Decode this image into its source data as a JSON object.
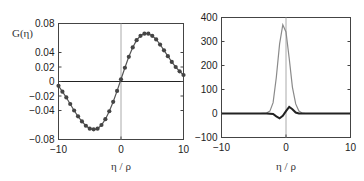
{
  "chart_data": [
    {
      "type": "line",
      "panel": "left",
      "title": "",
      "ylabel": "G(η)",
      "xlabel": "η / ρ",
      "xlim": [
        -10,
        10
      ],
      "ylim": [
        -0.08,
        0.08
      ],
      "xticks": [
        "-10",
        "0",
        "10"
      ],
      "yticks": [
        "0.08",
        "0.04",
        "0.02",
        "0",
        "-0.02",
        "-0.04",
        "-0.08"
      ],
      "ytick_values": [
        0.08,
        0.04,
        0.02,
        0,
        -0.02,
        -0.04,
        -0.08
      ],
      "grid": false,
      "reference_lines": {
        "y0": true,
        "x0": true
      },
      "series": [
        {
          "name": "G(η)",
          "style": "line-with-dots",
          "color": "#555555",
          "marker_color": "#444444",
          "x": [
            -10,
            -9.375,
            -8.75,
            -8.125,
            -7.5,
            -6.875,
            -6.25,
            -5.625,
            -5,
            -4.375,
            -3.75,
            -3.125,
            -2.5,
            -1.875,
            -1.25,
            -0.625,
            0,
            0.625,
            1.25,
            1.875,
            2.5,
            3.125,
            3.75,
            4.375,
            5,
            5.625,
            6.25,
            6.875,
            7.5,
            8.125,
            8.75,
            9.375,
            10
          ],
          "y": [
            -0.006,
            -0.014,
            -0.022,
            -0.031,
            -0.04,
            -0.048,
            -0.055,
            -0.061,
            -0.065,
            -0.066,
            -0.065,
            -0.06,
            -0.052,
            -0.041,
            -0.028,
            -0.013,
            0.003,
            0.019,
            0.034,
            0.047,
            0.057,
            0.063,
            0.066,
            0.066,
            0.063,
            0.058,
            0.051,
            0.043,
            0.035,
            0.027,
            0.02,
            0.014,
            0.009
          ]
        }
      ]
    },
    {
      "type": "line",
      "panel": "right",
      "title": "",
      "ylabel": "",
      "xlabel": "η / ρ",
      "xlim": [
        -10,
        10
      ],
      "ylim": [
        -100,
        400
      ],
      "xticks": [
        "-10",
        "0",
        "10"
      ],
      "yticks": [
        "400",
        "300",
        "200",
        "100",
        "0",
        "-100"
      ],
      "ytick_values": [
        400,
        300,
        200,
        100,
        0,
        -100
      ],
      "grid": false,
      "reference_lines": {
        "x0": true
      },
      "series": [
        {
          "name": "peak (gray)",
          "color": "#8a8a8a",
          "x": [
            -10,
            -4,
            -3,
            -2.5,
            -2,
            -1.5,
            -1,
            -0.5,
            0,
            0.5,
            1,
            1.5,
            2,
            2.5,
            3,
            10
          ],
          "y": [
            0,
            0,
            2,
            10,
            45,
            150,
            290,
            370,
            340,
            230,
            110,
            40,
            10,
            2,
            0,
            0
          ]
        },
        {
          "name": "oscillation (dark)",
          "color": "#222222",
          "x": [
            -10,
            -3,
            -2,
            -1.5,
            -1,
            -0.5,
            0,
            0.5,
            1,
            1.5,
            2,
            3,
            10
          ],
          "y": [
            0,
            0,
            -2,
            -12,
            -20,
            -10,
            10,
            28,
            18,
            4,
            0,
            0,
            0
          ]
        }
      ]
    }
  ],
  "left": {
    "ylabel": "G(η)",
    "xlabel": "η / ρ",
    "yticks": [
      "0.08",
      "0.04",
      "0.02",
      "0",
      "−0.02",
      "−0.04",
      "−0.08"
    ],
    "xticks": [
      "−10",
      "0",
      "10"
    ]
  },
  "right": {
    "xlabel": "η / ρ",
    "yticks": [
      "400",
      "300",
      "200",
      "100",
      "0",
      "−100"
    ],
    "xticks": [
      "−10",
      "0",
      "10"
    ]
  }
}
